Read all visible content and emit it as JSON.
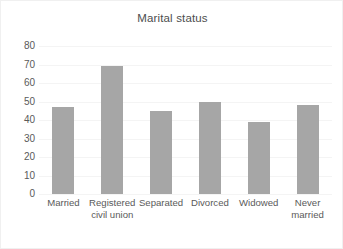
{
  "chart_data": {
    "type": "bar",
    "title": "Marital status",
    "xlabel": "",
    "ylabel": "",
    "categories": [
      "Married",
      "Registered civil union",
      "Separated",
      "Divorced",
      "Widowed",
      "Never married"
    ],
    "values": [
      47,
      69,
      45,
      50,
      39,
      48
    ],
    "ylim": [
      0,
      80
    ],
    "yticks": [
      0,
      10,
      20,
      30,
      40,
      50,
      60,
      70,
      80
    ],
    "ytick_labels": [
      "0",
      "10",
      "20",
      "30",
      "40",
      "50",
      "60",
      "70",
      "80"
    ],
    "grid": true,
    "legend": false,
    "bar_color": "#a6a6a6",
    "title_color": "#4d4d4d",
    "tick_color": "#5a5a5a",
    "gridline_color": "#f4f4f4",
    "background_color": "#ffffff",
    "border_color": "#f0f0f0"
  }
}
